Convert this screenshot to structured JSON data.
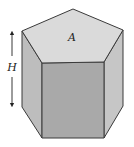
{
  "diagram": {
    "type": "pentagonal-prism",
    "labels": {
      "area": "A",
      "height": "H"
    },
    "colors": {
      "top_face": "#dadada",
      "front_face": "#a9a9a9",
      "left_face": "#bdbdbd",
      "right_face": "#c6c6c6",
      "edge": "#3a3a3a",
      "background": "#ffffff"
    },
    "vertices": {
      "top_apex": [
        73,
        9
      ],
      "top_left": [
        22,
        31
      ],
      "top_right": [
        123,
        30
      ],
      "top_front_left": [
        42,
        63
      ],
      "top_front_right": [
        104,
        62
      ],
      "bottom_left": [
        22,
        107
      ],
      "bottom_front_left": [
        42,
        138
      ],
      "bottom_front_right": [
        104,
        138
      ],
      "bottom_right": [
        123,
        106
      ]
    },
    "height_arrow": {
      "x": 12,
      "y_top": 32,
      "y_bottom": 106
    }
  }
}
